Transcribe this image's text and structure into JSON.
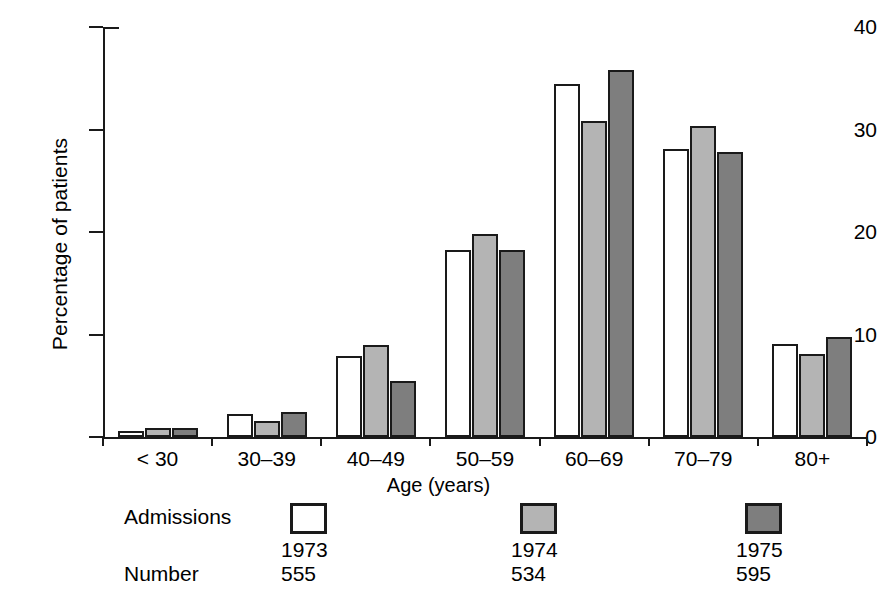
{
  "chart_data": {
    "type": "bar",
    "title": "",
    "xlabel": "Age (years)",
    "ylabel": "Percentage of patients",
    "categories": [
      "< 30",
      "30–39",
      "40–49",
      "50–59",
      "60–69",
      "70–79",
      "80+"
    ],
    "ylim": [
      0,
      40
    ],
    "yticks": [
      0,
      10,
      20,
      30,
      40
    ],
    "ytick_labels": [
      "0",
      "10",
      "20",
      "30",
      "40"
    ],
    "grid": false,
    "legend_position": "below-axes",
    "series": [
      {
        "name": "1973",
        "color": "#ffffff",
        "number": "555",
        "values": [
          0.6,
          2.2,
          7.9,
          18.2,
          34.4,
          28.1,
          9.1
        ]
      },
      {
        "name": "1974",
        "color": "#b4b4b4",
        "number": "534",
        "values": [
          0.9,
          1.6,
          9.0,
          19.8,
          30.8,
          30.3,
          8.1
        ]
      },
      {
        "name": "1975",
        "color": "#7e7e7e",
        "number": "595",
        "values": [
          0.9,
          2.4,
          5.5,
          18.2,
          35.8,
          27.8,
          9.8
        ]
      }
    ]
  },
  "axes": {
    "y_title": "Percentage of patients",
    "x_title": "Age (years)"
  },
  "legend": {
    "row_labels": {
      "admissions": "Admissions",
      "number": "Number"
    },
    "entries": [
      {
        "year": "1973",
        "number": "555",
        "swatch": "white-swatch"
      },
      {
        "year": "1974",
        "number": "534",
        "swatch": "light-gray-swatch"
      },
      {
        "year": "1975",
        "number": "595",
        "swatch": "dark-gray-swatch"
      }
    ]
  },
  "colors": {
    "series_1973": "#ffffff",
    "series_1974": "#b4b4b4",
    "series_1975": "#7e7e7e",
    "ink": "#1a1a1a",
    "background": "#ffffff"
  }
}
